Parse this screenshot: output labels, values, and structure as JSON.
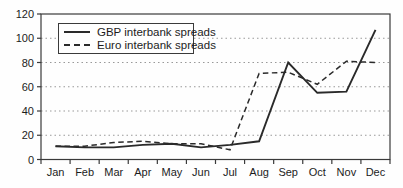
{
  "figure": {
    "background": "#fefefe",
    "border_color": "#3a3a3a",
    "grid_color": "#999999",
    "line_color": "#2a2a2a",
    "text_color": "#1c1c1c"
  },
  "chart_data": {
    "type": "line",
    "title": "",
    "xlabel": "",
    "ylabel": "",
    "categories": [
      "Jan",
      "Feb",
      "Mar",
      "Apr",
      "May",
      "Jun",
      "Jul",
      "Aug",
      "Sep",
      "Oct",
      "Nov",
      "Dec"
    ],
    "series": [
      {
        "name": "GBP interbank spreads",
        "style": "solid",
        "values": [
          11,
          10,
          10,
          12,
          13,
          10,
          12,
          15,
          80,
          55,
          56,
          107
        ]
      },
      {
        "name": "Euro interbank spreads",
        "style": "dashed",
        "values": [
          11,
          11,
          14,
          15,
          13,
          13,
          8,
          71,
          72,
          62,
          81,
          80
        ]
      }
    ],
    "ylim": [
      0,
      120
    ],
    "y_ticks": [
      0,
      20,
      40,
      60,
      80,
      100,
      120
    ],
    "grid": "horizontal-dotted",
    "legend_position": "top-left"
  }
}
